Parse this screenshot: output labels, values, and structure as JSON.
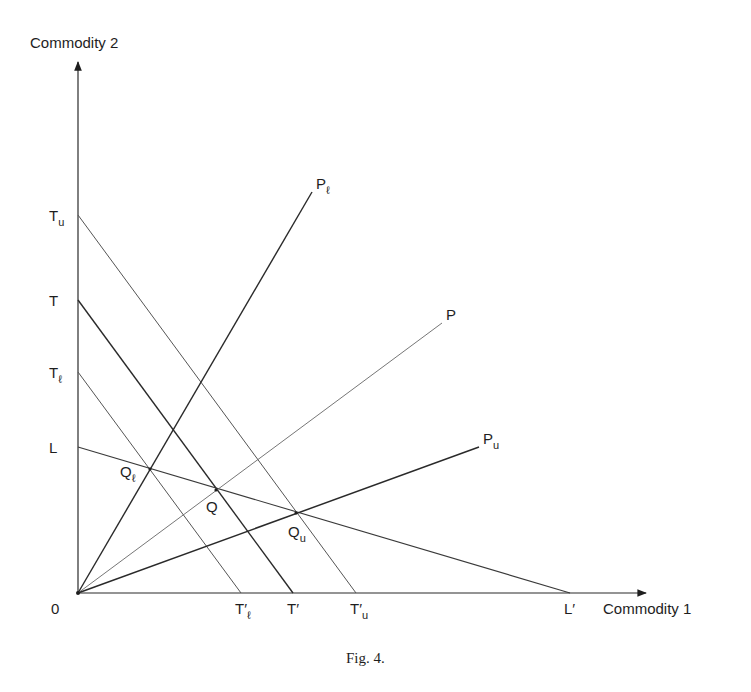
{
  "figure": {
    "caption": "Fig. 4.",
    "y_axis_label": "Commodity 2",
    "x_axis_label": "Commodity 1",
    "origin_label": "0"
  },
  "chart_data": {
    "type": "diagram",
    "title": "Fig. 4.",
    "xlabel": "Commodity 1",
    "ylabel": "Commodity 2",
    "axes": {
      "origin": [
        78,
        593
      ],
      "x_end": [
        648,
        593
      ],
      "y_end": [
        78,
        60
      ]
    },
    "lines": [
      {
        "name": "Tu-Tu'",
        "from": [
          78,
          215
        ],
        "to": [
          356,
          593
        ],
        "start_label": "T",
        "start_sub": "u",
        "end_label": "T′",
        "end_sub": "u",
        "weight": 1.0,
        "color": "#555555"
      },
      {
        "name": "T-T'",
        "from": [
          78,
          300
        ],
        "to": [
          293,
          593
        ],
        "start_label": "T",
        "start_sub": "",
        "end_label": "T′",
        "end_sub": "",
        "weight": 1.4,
        "color": "#2a2a2a"
      },
      {
        "name": "Tl-Tl'",
        "from": [
          78,
          372
        ],
        "to": [
          241,
          593
        ],
        "start_label": "T",
        "start_sub": "ℓ",
        "end_label": "T′",
        "end_sub": "ℓ",
        "weight": 1.0,
        "color": "#555555"
      },
      {
        "name": "L-L'",
        "from": [
          78,
          447
        ],
        "to": [
          570,
          593
        ],
        "start_label": "L",
        "start_sub": "",
        "end_label": "L′",
        "end_sub": "",
        "weight": 1.1,
        "color": "#3a3a3a"
      }
    ],
    "rays": [
      {
        "name": "Pl",
        "from": [
          78,
          593
        ],
        "to": [
          312,
          192
        ],
        "label": "P",
        "sub": "ℓ",
        "weight": 1.4,
        "color": "#2a2a2a"
      },
      {
        "name": "P",
        "from": [
          78,
          593
        ],
        "to": [
          442,
          323
        ],
        "label": "P",
        "sub": "",
        "weight": 0.9,
        "color": "#666666"
      },
      {
        "name": "Pu",
        "from": [
          78,
          593
        ],
        "to": [
          479,
          447
        ],
        "label": "P",
        "sub": "u",
        "weight": 1.5,
        "color": "#2a2a2a"
      }
    ],
    "points": [
      {
        "name": "Ql",
        "xy": [
          150,
          469
        ],
        "label": "Q",
        "sub": "ℓ"
      },
      {
        "name": "Q",
        "xy": [
          216,
          490
        ],
        "label": "Q",
        "sub": ""
      },
      {
        "name": "Qu",
        "xy": [
          296,
          513
        ],
        "label": "Q",
        "sub": "u"
      }
    ]
  }
}
